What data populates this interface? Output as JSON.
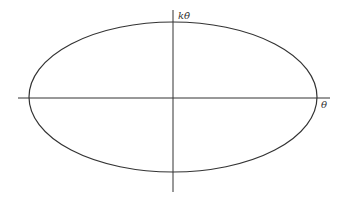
{
  "diagram": {
    "type": "phase-portrait",
    "axes": {
      "horizontal_label": "θ",
      "vertical_label": "kθ̇"
    },
    "curve": {
      "shape": "ellipse",
      "color": "#333333"
    },
    "axis_color": "#333333"
  }
}
